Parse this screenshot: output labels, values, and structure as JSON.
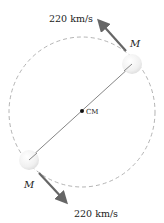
{
  "diagram": {
    "orbit": {
      "cx": 82,
      "cy": 112,
      "rx": 73,
      "ry": 75,
      "stroke": "#aaaaaa"
    },
    "center_of_mass": {
      "label": "CM",
      "x": 82,
      "y": 111
    },
    "masses": [
      {
        "label": "M",
        "x": 132,
        "y": 64,
        "r": 10
      },
      {
        "label": "M",
        "x": 29,
        "y": 160,
        "r": 10
      }
    ],
    "velocities": [
      {
        "label": "220 km/s",
        "from": [
          126,
          51
        ],
        "to": [
          98,
          20
        ]
      },
      {
        "label": "220 km/s",
        "from": [
          39,
          173
        ],
        "to": [
          67,
          203
        ]
      }
    ],
    "arrow_color": "#666666",
    "line_color": "#777777"
  }
}
